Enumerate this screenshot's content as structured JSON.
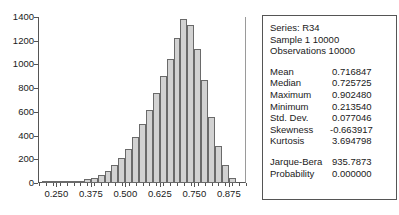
{
  "chart_data": {
    "type": "bar",
    "title": "",
    "xlabel": "",
    "ylabel": "",
    "grid": false,
    "legend": "none",
    "xlim": [
      0.1875,
      0.9375
    ],
    "ylim": [
      0,
      1400
    ],
    "bin_width": 0.025,
    "yticks": [
      0,
      200,
      400,
      600,
      800,
      1000,
      1200,
      1400
    ],
    "ytick_labels": [
      "0",
      "200",
      "400",
      "600",
      "800",
      "1000",
      "1200",
      "1400"
    ],
    "xticks": [
      0.25,
      0.375,
      0.5,
      0.625,
      0.75,
      0.875
    ],
    "xtick_labels": [
      "0.250",
      "0.375",
      "0.500",
      "0.625",
      "0.750",
      "0.875"
    ],
    "bin_centers": [
      0.2125,
      0.2375,
      0.2625,
      0.2875,
      0.3125,
      0.3375,
      0.3625,
      0.3875,
      0.4125,
      0.4375,
      0.4625,
      0.4875,
      0.5125,
      0.5375,
      0.5625,
      0.5875,
      0.6125,
      0.6375,
      0.6625,
      0.6875,
      0.7125,
      0.7375,
      0.7625,
      0.7875,
      0.8125,
      0.8375,
      0.8625,
      0.8875
    ],
    "values": [
      2,
      4,
      6,
      9,
      14,
      20,
      30,
      45,
      70,
      105,
      150,
      210,
      290,
      390,
      500,
      620,
      760,
      900,
      1050,
      1220,
      1380,
      1330,
      1130,
      870,
      560,
      310,
      150,
      40
    ]
  },
  "stats": {
    "header": [
      "Series: R34",
      "Sample 1 10000",
      "Observations 10000"
    ],
    "rows": [
      {
        "key": "Mean",
        "value": "0.716847"
      },
      {
        "key": "Median",
        "value": "0.725725"
      },
      {
        "key": "Maximum",
        "value": "0.902480"
      },
      {
        "key": "Minimum",
        "value": "0.213540"
      },
      {
        "key": "Std. Dev.",
        "value": "0.077046"
      },
      {
        "key": "Skewness",
        "value": "-0.663917"
      },
      {
        "key": "Kurtosis",
        "value": "3.694798"
      }
    ],
    "tests": [
      {
        "key": "Jarque-Bera",
        "value": "935.7873"
      },
      {
        "key": "Probability",
        "value": "0.000000"
      }
    ]
  },
  "colors": {
    "bar_fill": "#d2d2d2",
    "bar_border": "#6a6a6a",
    "axis": "#555555",
    "text": "#1a1a1a",
    "panel_border": "#555555"
  }
}
